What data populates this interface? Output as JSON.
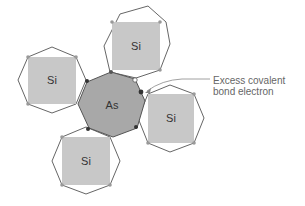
{
  "diagram": {
    "title": "",
    "colors": {
      "octagon_stroke": "#666666",
      "si_square_fill": "#c8c8c8",
      "as_fill": "#a8a8a8",
      "as_stroke": "#555555",
      "bond_dot": "#999999",
      "electron_dot": "#333333",
      "hole_dot": "#ffffff",
      "label_text": "#666666",
      "leader_line": "#888888"
    },
    "center_atom": {
      "label": "As"
    },
    "neighbor_atoms": [
      {
        "id": "top",
        "label": "Si"
      },
      {
        "id": "left",
        "label": "Si"
      },
      {
        "id": "right",
        "label": "Si"
      },
      {
        "id": "bottom",
        "label": "Si"
      }
    ],
    "callout": {
      "line1": "Excess covalent",
      "line2": "bond electron"
    }
  }
}
